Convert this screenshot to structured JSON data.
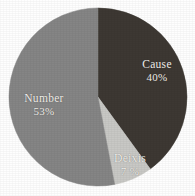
{
  "chart_data": {
    "type": "pie",
    "title": "",
    "subtitle": "",
    "xlabel": "",
    "ylabel": "",
    "legend_position": "none",
    "grid": false,
    "labels_inside_slices": true,
    "start_angle_deg": 0,
    "direction": "clockwise",
    "categories": [
      "Cause",
      "Number",
      "Deixis"
    ],
    "values": [
      40,
      53,
      7
    ],
    "value_unit": "percent",
    "slices": [
      {
        "name": "Cause",
        "value": 40,
        "value_text": "40%",
        "color": "#3d3833",
        "start_deg": 0,
        "end_deg": 144
      },
      {
        "name": "Deixis",
        "value": 7,
        "value_text": "7 %",
        "color": "#c8c8c5",
        "start_deg": 144,
        "end_deg": 169.2
      },
      {
        "name": "Number",
        "value": 53,
        "value_text": "53%",
        "color": "#858585",
        "start_deg": 169.2,
        "end_deg": 360
      }
    ]
  },
  "figure": {
    "background_color": "#fefefe",
    "label_text_color": "#f2f0ec",
    "center_x": 98,
    "center_y": 97,
    "radius": 89
  },
  "labels": {
    "cause": {
      "name": "Cause",
      "value_text": "40%"
    },
    "number": {
      "name": "Number",
      "value_text": "53%"
    },
    "deixis": {
      "name": "Deixis",
      "value_text": "7 %"
    }
  }
}
